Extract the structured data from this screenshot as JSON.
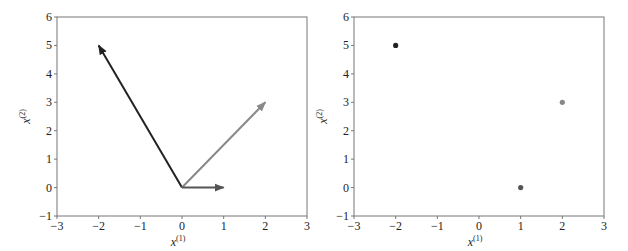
{
  "chart_data": [
    {
      "type": "quiver",
      "title": "",
      "xlabel": "x(1)",
      "ylabel": "x(2)",
      "xlim": [
        -3,
        3
      ],
      "ylim": [
        -1,
        6
      ],
      "xticks": [
        "−3",
        "−2",
        "−1",
        "0",
        "1",
        "2",
        "3"
      ],
      "yticks": [
        "−1",
        "0",
        "1",
        "2",
        "3",
        "4",
        "5",
        "6"
      ],
      "grid": false,
      "vectors": [
        {
          "origin": [
            0,
            0
          ],
          "end": [
            -2,
            5
          ],
          "color": "#222222"
        },
        {
          "origin": [
            0,
            0
          ],
          "end": [
            2,
            3
          ],
          "color": "#888888"
        },
        {
          "origin": [
            0,
            0
          ],
          "end": [
            1,
            0
          ],
          "color": "#555555"
        }
      ]
    },
    {
      "type": "scatter",
      "title": "",
      "xlabel": "x(1)",
      "ylabel": "x(2)",
      "xlim": [
        -3,
        3
      ],
      "ylim": [
        -1,
        6
      ],
      "xticks": [
        "−3",
        "−2",
        "−1",
        "0",
        "1",
        "2",
        "3"
      ],
      "yticks": [
        "−1",
        "0",
        "1",
        "2",
        "3",
        "4",
        "5",
        "6"
      ],
      "grid": false,
      "points": [
        {
          "x": -2,
          "y": 5,
          "color": "#222222"
        },
        {
          "x": 2,
          "y": 3,
          "color": "#888888"
        },
        {
          "x": 1,
          "y": 0,
          "color": "#555555"
        }
      ]
    }
  ],
  "labels": {
    "x_base": "x",
    "x_sup": "(1)",
    "y_base": "x",
    "y_sup": "(2)"
  }
}
